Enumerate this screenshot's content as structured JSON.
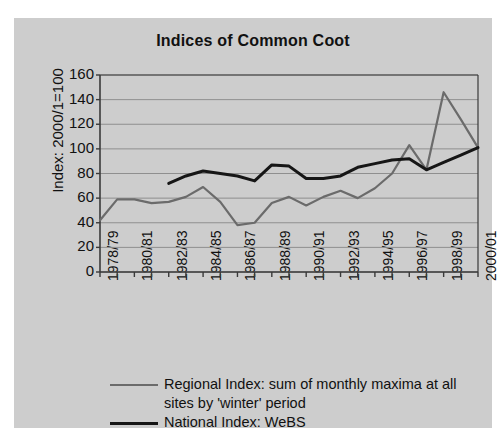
{
  "chart_data": {
    "type": "line",
    "title": "Indices of Common Coot",
    "xlabel": "",
    "ylabel": "Index: 2000/1=100",
    "ylim": [
      0,
      160
    ],
    "ytick_step": 20,
    "yticks": [
      160,
      140,
      120,
      100,
      80,
      60,
      40,
      20,
      0
    ],
    "grid": true,
    "legend_position": "bottom",
    "categories": [
      "1978/79",
      "1979/80",
      "1980/81",
      "1981/82",
      "1982/83",
      "1983/84",
      "1984/85",
      "1985/86",
      "1986/87",
      "1987/88",
      "1988/89",
      "1989/90",
      "1990/91",
      "1991/92",
      "1992/93",
      "1993/94",
      "1994/95",
      "1995/96",
      "1996/97",
      "1997/98",
      "1998/99",
      "1999/00",
      "2000/01"
    ],
    "xtick_labels": [
      "1978/79",
      "",
      "1980/81",
      "",
      "1982/83",
      "",
      "1984/85",
      "",
      "1986/87",
      "",
      "1988/89",
      "",
      "1990/91",
      "",
      "1992/93",
      "",
      "1994/95",
      "",
      "1996/97",
      "",
      "1998/99",
      "",
      "2000/01"
    ],
    "series": [
      {
        "name": "Regional Index: sum of monthly maxima at all sites by 'winter' period",
        "color": "#6b6b6b",
        "values": [
          42,
          59,
          59,
          56,
          57,
          61,
          69,
          57,
          38,
          40,
          56,
          61,
          54,
          61,
          66,
          60,
          68,
          80,
          103,
          83,
          146,
          124,
          101
        ]
      },
      {
        "name": "National Index: WeBS",
        "color": "#161616",
        "values": [
          null,
          null,
          null,
          null,
          72,
          78,
          82,
          80,
          78,
          74,
          87,
          86,
          76,
          76,
          78,
          85,
          88,
          91,
          92,
          83,
          89,
          95,
          101
        ]
      }
    ]
  },
  "legend": {
    "entries": [
      {
        "label": "Regional Index: sum of monthly maxima at all sites by 'winter' period",
        "color": "#6b6b6b"
      },
      {
        "label": "National Index: WeBS",
        "color": "#161616"
      }
    ]
  },
  "colors": {
    "panel_background": "#cdcdcd",
    "page_background": "#ffffff",
    "axis": "#3a3a3a",
    "grid": "#8f8f8f",
    "text": "#111111"
  }
}
